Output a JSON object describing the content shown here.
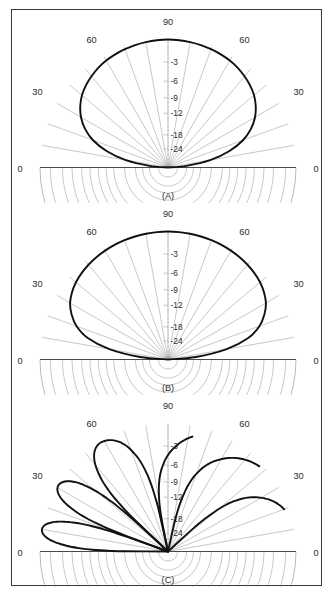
{
  "figure": {
    "title": "",
    "panels": [
      {
        "id": "A",
        "caption": "(A)"
      },
      {
        "id": "B",
        "caption": "(B)"
      },
      {
        "id": "C",
        "caption": "(C)"
      }
    ]
  },
  "axes": {
    "angle_label_0_left": "0",
    "angle_label_30_left": "30",
    "angle_label_60_left": "60",
    "angle_label_90": "90",
    "angle_label_60_right": "60",
    "angle_label_30_right": "30",
    "angle_label_0_right": "0",
    "radial_labels": [
      "-3",
      "-6",
      "-9",
      "-12",
      "-18",
      "-24"
    ]
  },
  "colors": {
    "curve": "#111111",
    "grid": "#9a9a9a",
    "baseline": "#4a4a4a",
    "frame": "#3a3a3a",
    "text": "#2b2b2b",
    "background": "#ffffff"
  },
  "chart_data": {
    "type": "line",
    "plot_kind": "polar-half-plane-antenna-pattern",
    "title": "",
    "xlabel": "Elevation angle (degrees)",
    "ylabel": "Relative gain (dB)",
    "grid": true,
    "legend": "none",
    "angle_axis": {
      "label": "elevation angle",
      "unit": "degrees",
      "range": [
        0,
        180
      ],
      "tick_step": 10,
      "labeled_ticks": [
        0,
        30,
        60,
        90,
        120,
        150,
        180
      ],
      "tick_labels": [
        "0",
        "30",
        "60",
        "90",
        "60",
        "30",
        "0"
      ]
    },
    "radial_axis": {
      "label": "relative gain",
      "unit": "dB",
      "ring_values_db": [
        -3,
        -6,
        -9,
        -12,
        -18,
        -24
      ],
      "ring_fractional_radius": [
        0.175,
        0.325,
        0.455,
        0.575,
        0.745,
        0.855
      ],
      "outer_value_db": 0,
      "center_value_db": -40
    },
    "series": [
      {
        "name": "(A) pattern",
        "panel": "A",
        "angles_deg": [
          0,
          5,
          10,
          15,
          20,
          25,
          30,
          35,
          40,
          45,
          50,
          55,
          60,
          65,
          70,
          75,
          80,
          85,
          90,
          95,
          100,
          105,
          110,
          115,
          120,
          125,
          130,
          135,
          140,
          145,
          150,
          155,
          160,
          165,
          170,
          175,
          180
        ],
        "values_db": [
          -40,
          -24,
          -15,
          -10.2,
          -7.2,
          -5.2,
          -3.8,
          -2.8,
          -2.1,
          -1.6,
          -1.2,
          -0.85,
          -0.6,
          -0.42,
          -0.28,
          -0.17,
          -0.09,
          -0.03,
          0,
          -0.03,
          -0.09,
          -0.17,
          -0.28,
          -0.42,
          -0.6,
          -0.85,
          -1.2,
          -1.6,
          -2.1,
          -2.8,
          -3.8,
          -5.2,
          -7.2,
          -10.2,
          -15,
          -24,
          -40
        ]
      },
      {
        "name": "(B) pattern",
        "panel": "B",
        "angles_deg": [
          0,
          5,
          10,
          15,
          20,
          25,
          30,
          35,
          40,
          45,
          50,
          55,
          60,
          65,
          70,
          75,
          80,
          85,
          90,
          95,
          100,
          105,
          110,
          115,
          120,
          125,
          130,
          135,
          140,
          145,
          150,
          155,
          160,
          165,
          170,
          175,
          180
        ],
        "values_db": [
          -40,
          -20,
          -11,
          -6.6,
          -4.3,
          -2.9,
          -2.0,
          -1.45,
          -1.05,
          -0.78,
          -0.58,
          -0.42,
          -0.3,
          -0.21,
          -0.14,
          -0.085,
          -0.045,
          -0.015,
          0,
          -0.015,
          -0.045,
          -0.085,
          -0.14,
          -0.21,
          -0.3,
          -0.42,
          -0.58,
          -0.78,
          -1.05,
          -1.45,
          -2.0,
          -2.9,
          -4.3,
          -6.6,
          -11,
          -20,
          -40
        ]
      },
      {
        "name": "(C) pattern",
        "panel": "C",
        "lobe_peak_angles_deg": [
          10,
          31,
          58,
          122,
          149,
          170
        ],
        "lobe_peak_values_db": [
          0,
          0,
          0,
          0,
          0,
          0
        ],
        "null_angles_deg": [
          0,
          20,
          43,
          78,
          102,
          137,
          160,
          180
        ],
        "description": "six-lobe interference pattern, mirror symmetric about 90 degrees"
      }
    ]
  }
}
